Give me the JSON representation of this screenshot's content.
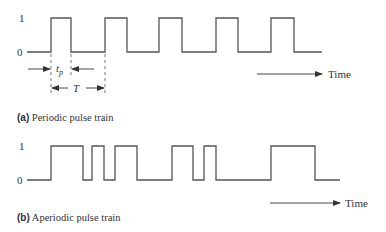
{
  "panel_a": {
    "level_high_label": "1",
    "level_low_label": "0",
    "pulse_width_label": "t",
    "pulse_width_subscript": "p",
    "period_label": "T",
    "time_label": "Time",
    "caption_tag": "(a)",
    "caption_text": "Periodic pulse train",
    "waveform_points": "27,52 51,52 51,18 71,18 71,52 105,52 105,18 127,18 127,52 159,52 159,18 182,18 182,52 216,52 216,18 238,18 238,52 271,52 271,18 294,18 294,52 322,52"
  },
  "panel_b": {
    "level_high_label": "1",
    "level_low_label": "0",
    "time_label": "Time",
    "caption_tag": "(b)",
    "caption_text": "Aperiodic pulse train",
    "waveform_points": "27,180 51,180 51,146 83,146 83,180 92,180 92,146 104,146 104,180 115,180 115,146 137,146 137,180 172,180 172,146 193,146 193,180 204,180 204,146 216,146 216,180 271,180 271,146 315,146 315,180 340,180"
  },
  "colors": {
    "line": "#555555",
    "text": "#333333",
    "background": "#ffffff"
  }
}
